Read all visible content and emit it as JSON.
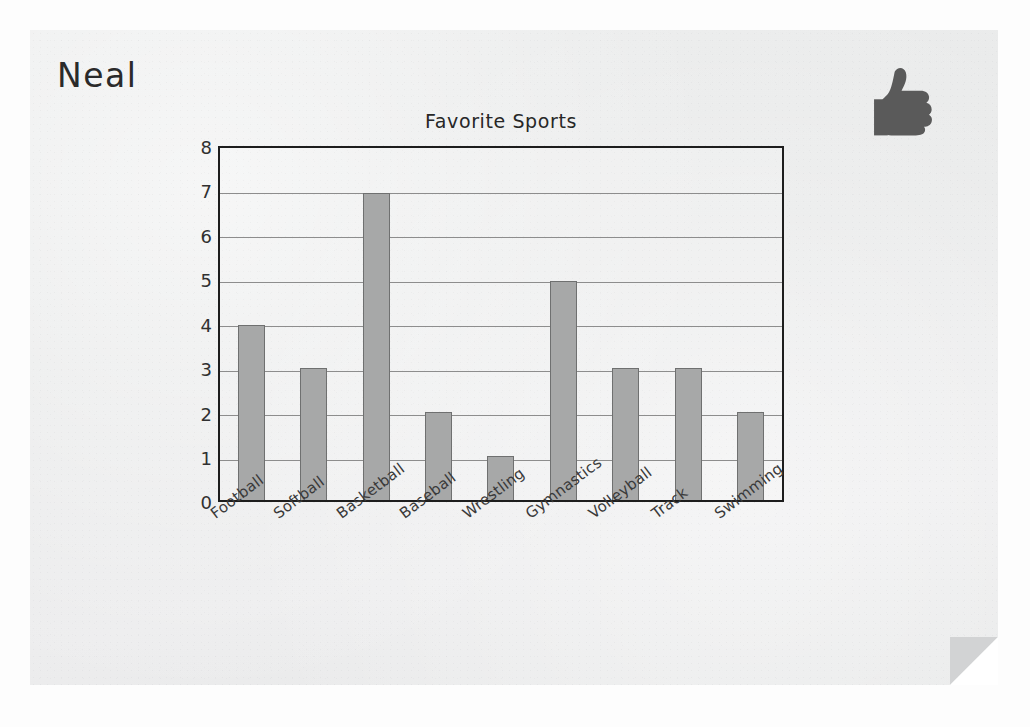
{
  "worksheet": {
    "student_name": "Neal",
    "sticker_icon": "thumbs-up-icon",
    "sticker_color": "#5a5a5a",
    "page_background": "#eceded",
    "fold_color": "#d2d3d4"
  },
  "chart_data": {
    "type": "bar",
    "title": "Favorite Sports",
    "xlabel": "",
    "ylabel": "",
    "categories": [
      "Football",
      "Softball",
      "Basketball",
      "Baseball",
      "Wrestling",
      "Gymnastics",
      "Volleyball",
      "Track",
      "Swimming"
    ],
    "values": [
      4,
      3,
      7,
      2,
      1,
      5,
      3,
      3,
      2
    ],
    "ylim": [
      0,
      8
    ],
    "ytick_labels": [
      "0",
      "1",
      "2",
      "3",
      "4",
      "5",
      "6",
      "7",
      "8"
    ],
    "ytick_values": [
      0,
      1,
      2,
      3,
      4,
      5,
      6,
      7,
      8
    ],
    "grid": true,
    "legend": false,
    "bar_color": "#a7a8a8",
    "bar_edge_color": "#6f7070",
    "grid_color": "#8d8d8d",
    "frame_color": "#1d1d1d"
  }
}
